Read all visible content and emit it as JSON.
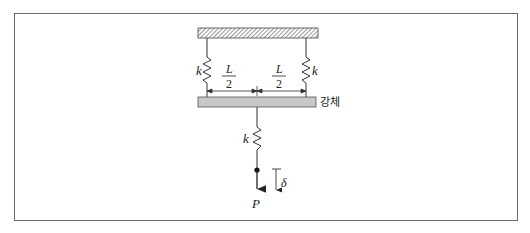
{
  "diagram": {
    "labels": {
      "left_spring": "k",
      "right_spring": "k",
      "bottom_spring": "k",
      "half_length_num_left": "L",
      "half_length_den_left": "2",
      "half_length_num_right": "L",
      "half_length_den_right": "2",
      "rigid_body": "강체",
      "load": "P",
      "deflection": "δ"
    },
    "colors": {
      "frame": "#6e6e6e",
      "line": "#333333",
      "rigid_bar_fill": "#c8c8c8",
      "ceiling_hatch": "#555555"
    }
  }
}
